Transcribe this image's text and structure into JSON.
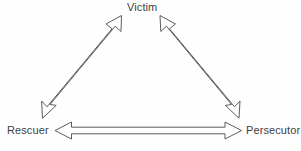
{
  "diagram": {
    "background_color": "#ffffff",
    "line_color": "#4a4a4a",
    "text_color": "#3f3f3f",
    "nodes": [
      {
        "id": "victim",
        "label": "Victim",
        "position": "top"
      },
      {
        "id": "rescuer",
        "label": "Rescuer",
        "position": "bottom-left"
      },
      {
        "id": "persecutor",
        "label": "Persecutor",
        "position": "bottom-right"
      }
    ],
    "connectors": [
      {
        "id": "rescuer-victim",
        "from": "Rescuer",
        "to": "Victim",
        "style": "hollow-double-headed-arrow",
        "orientation": "diagonal-left"
      },
      {
        "id": "victim-persecutor",
        "from": "Victim",
        "to": "Persecutor",
        "style": "hollow-double-headed-arrow",
        "orientation": "diagonal-right"
      },
      {
        "id": "rescuer-persecutor",
        "from": "Rescuer",
        "to": "Persecutor",
        "style": "hollow-double-headed-arrow",
        "orientation": "horizontal"
      }
    ]
  }
}
